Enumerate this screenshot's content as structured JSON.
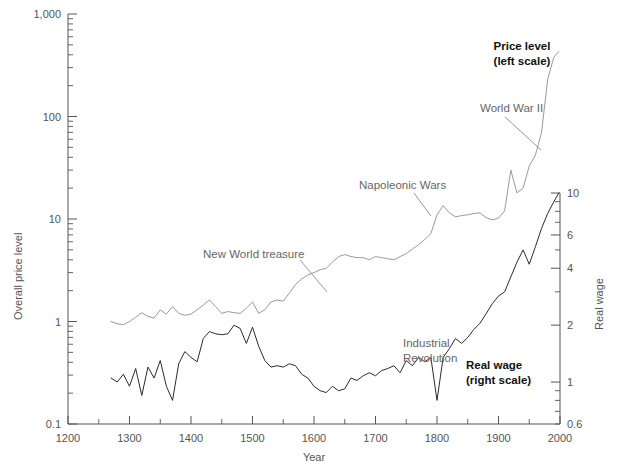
{
  "chart_data": {
    "type": "line",
    "title": "",
    "xlabel": "Year",
    "ylabel": "Overall price level",
    "y2label": "Real wage",
    "xlim": [
      1200,
      2000
    ],
    "ylim": [
      0.1,
      1000
    ],
    "y2lim": [
      0.6,
      10
    ],
    "yscale": "log",
    "y2scale": "log",
    "grid": false,
    "legend_position": "inline-annotations",
    "x_ticks": [
      1200,
      1300,
      1400,
      1500,
      1600,
      1700,
      1800,
      1900,
      2000
    ],
    "x_tick_labels": [
      "1200",
      "1300",
      "1400",
      "1500",
      "1600",
      "1700",
      "1800",
      "1900",
      "2000"
    ],
    "x_minor_ticks": [
      1250,
      1350,
      1450,
      1550,
      1650,
      1750,
      1850,
      1950
    ],
    "y_ticks": [
      0.1,
      1,
      10,
      100,
      1000
    ],
    "y_tick_labels": [
      "0.1",
      "1",
      "10",
      "100",
      "1,000"
    ],
    "y2_ticks": [
      0.6,
      1,
      2,
      4,
      6,
      10
    ],
    "y2_tick_labels": [
      "0.6",
      "1",
      "2",
      "4",
      "6",
      "10"
    ],
    "series": [
      {
        "name": "Price level (left scale)",
        "axis": "left",
        "color": "#9a9a9a",
        "x": [
          1270,
          1280,
          1290,
          1300,
          1310,
          1320,
          1330,
          1340,
          1350,
          1360,
          1370,
          1380,
          1390,
          1400,
          1410,
          1420,
          1430,
          1440,
          1450,
          1460,
          1470,
          1480,
          1490,
          1500,
          1510,
          1520,
          1530,
          1540,
          1550,
          1560,
          1570,
          1580,
          1590,
          1600,
          1610,
          1620,
          1630,
          1640,
          1650,
          1660,
          1670,
          1680,
          1690,
          1700,
          1710,
          1720,
          1730,
          1740,
          1750,
          1760,
          1770,
          1780,
          1790,
          1800,
          1810,
          1820,
          1830,
          1840,
          1850,
          1860,
          1870,
          1880,
          1890,
          1900,
          1910,
          1920,
          1930,
          1940,
          1950,
          1960,
          1970,
          1980,
          1990,
          1998
        ],
        "y": [
          1.0,
          0.95,
          0.93,
          1.0,
          1.1,
          1.22,
          1.12,
          1.08,
          1.3,
          1.18,
          1.4,
          1.2,
          1.15,
          1.18,
          1.3,
          1.45,
          1.62,
          1.4,
          1.2,
          1.25,
          1.22,
          1.2,
          1.35,
          1.55,
          1.2,
          1.3,
          1.55,
          1.62,
          1.58,
          1.9,
          2.3,
          2.6,
          2.85,
          3.0,
          3.2,
          3.3,
          3.8,
          4.3,
          4.5,
          4.3,
          4.2,
          4.2,
          4.0,
          4.3,
          4.2,
          4.1,
          4.0,
          4.3,
          4.6,
          5.1,
          5.6,
          6.3,
          7.2,
          11.0,
          13.5,
          11.5,
          10.5,
          10.8,
          11.0,
          11.3,
          11.5,
          10.3,
          9.8,
          10.2,
          12.0,
          30.0,
          18.0,
          20.0,
          33.0,
          42.0,
          70.0,
          230.0,
          380.0,
          430.0
        ]
      },
      {
        "name": "Real wage (right scale)",
        "axis": "right",
        "color": "#2b2b2b",
        "x": [
          1270,
          1280,
          1290,
          1300,
          1310,
          1320,
          1330,
          1340,
          1350,
          1360,
          1370,
          1380,
          1390,
          1400,
          1410,
          1420,
          1430,
          1440,
          1450,
          1460,
          1470,
          1480,
          1490,
          1500,
          1510,
          1520,
          1530,
          1540,
          1550,
          1560,
          1570,
          1580,
          1590,
          1600,
          1610,
          1620,
          1630,
          1640,
          1650,
          1660,
          1670,
          1680,
          1690,
          1700,
          1710,
          1720,
          1730,
          1740,
          1750,
          1760,
          1770,
          1780,
          1790,
          1800,
          1810,
          1820,
          1830,
          1840,
          1850,
          1860,
          1870,
          1880,
          1890,
          1900,
          1910,
          1920,
          1930,
          1940,
          1950,
          1960,
          1970,
          1980,
          1990,
          1998
        ],
        "y": [
          1.05,
          1.0,
          1.1,
          0.95,
          1.18,
          0.85,
          1.2,
          1.05,
          1.3,
          0.95,
          0.8,
          1.25,
          1.45,
          1.35,
          1.28,
          1.7,
          1.85,
          1.8,
          1.78,
          1.8,
          2.0,
          1.92,
          1.6,
          1.95,
          1.55,
          1.3,
          1.2,
          1.22,
          1.2,
          1.25,
          1.22,
          1.1,
          1.05,
          0.95,
          0.9,
          0.88,
          0.95,
          0.9,
          0.92,
          1.05,
          1.02,
          1.08,
          1.12,
          1.08,
          1.15,
          1.18,
          1.22,
          1.12,
          1.3,
          1.22,
          1.35,
          1.28,
          1.35,
          0.8,
          1.35,
          1.5,
          1.7,
          1.6,
          1.72,
          1.9,
          2.05,
          2.3,
          2.6,
          2.85,
          3.0,
          3.6,
          4.3,
          5.0,
          4.2,
          5.2,
          6.5,
          7.8,
          9.0,
          10.0
        ]
      }
    ],
    "annotations": [
      {
        "text": "Price level",
        "text2": "(left scale)",
        "bold": true,
        "x": 522,
        "y": 50
      },
      {
        "text": "World War II",
        "bold": false,
        "x": 480,
        "y": 109
      },
      {
        "text": "Napoleonic Wars",
        "bold": false,
        "x": 359,
        "y": 186
      },
      {
        "text": "New World treasure",
        "bold": false,
        "x": 203,
        "y": 255
      },
      {
        "text": "Industrial",
        "text2": "Revolution",
        "bold": false,
        "x": 403,
        "y": 344
      },
      {
        "text": "Real wage",
        "text2": "(right scale)",
        "bold": true,
        "x": 466,
        "y": 366
      }
    ]
  },
  "labels": {
    "y_axis_title": "Overall price level",
    "y2_axis_title": "Real wage",
    "x_axis_title": "Year",
    "ann_price_level_1": "Price level",
    "ann_price_level_2": "(left scale)",
    "ann_wwii": "World War II",
    "ann_napoleonic": "Napoleonic Wars",
    "ann_new_world": "New World treasure",
    "ann_indrev_1": "Industrial",
    "ann_indrev_2": "Revolution",
    "ann_realwage_1": "Real wage",
    "ann_realwage_2": "(right scale)"
  },
  "colors": {
    "price_level_line": "#9a9a9a",
    "real_wage_line": "#2b2b2b",
    "axis": "#555555",
    "background": "#ffffff"
  }
}
